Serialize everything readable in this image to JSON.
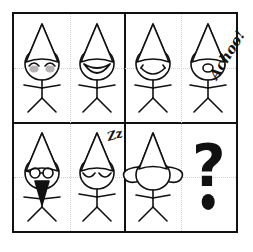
{
  "puzzle": {
    "title": "Non-verbal reasoning stick-figure matrix",
    "grid": {
      "rows": 2,
      "columns": 4,
      "quadrants": 2
    },
    "colors": {
      "ink": "#111111",
      "paper": "#ffffff",
      "blush": "#b9b2b4",
      "minor_divider": "#cfcfcf"
    },
    "cells": [
      {
        "index": 1,
        "position": "row1-col1",
        "figure_name": "happy-blushing-gnome",
        "expression": "closed smiling eyes with blushing cheeks",
        "hat": "tall cone hat",
        "features": [
          "curved-closed-eyes",
          "blush-cheeks"
        ],
        "annotation": ""
      },
      {
        "index": 2,
        "position": "row1-col2",
        "figure_name": "big-smile-gnome",
        "expression": "wide open smiling mouth",
        "hat": "tall cone hat",
        "features": [
          "open-smile-mouth"
        ],
        "annotation": ""
      },
      {
        "index": 3,
        "position": "row1-col3",
        "figure_name": "sad-frowning-gnome",
        "expression": "downturned frowning mouth",
        "hat": "tall cone hat",
        "features": [
          "frown-mouth"
        ],
        "annotation": ""
      },
      {
        "index": 4,
        "position": "row1-col4",
        "figure_name": "sneezing-gnome",
        "expression": "small round open mouth, sneezing",
        "hat": "tall cone hat",
        "features": [
          "small-oval-mouth"
        ],
        "annotation": "Achoo!"
      },
      {
        "index": 5,
        "position": "row2-col1",
        "figure_name": "bearded-glasses-gnome",
        "expression": "round glasses and black beard",
        "hat": "tall cone hat",
        "features": [
          "round-glasses",
          "black-triangular-beard"
        ],
        "annotation": ""
      },
      {
        "index": 6,
        "position": "row2-col2",
        "figure_name": "sleeping-gnome",
        "expression": "closed sleeping eyes",
        "hat": "tall cone hat",
        "features": [
          "closed-sleeping-eyes"
        ],
        "annotation": "Zz"
      },
      {
        "index": 7,
        "position": "row2-col3",
        "figure_name": "big-eared-gnome",
        "expression": "blank face with large ears",
        "hat": "tall cone hat",
        "features": [
          "large-left-ear",
          "large-right-ear"
        ],
        "annotation": ""
      },
      {
        "index": 8,
        "position": "row2-col4",
        "figure_name": "missing-answer",
        "expression": "unknown",
        "hat": "",
        "features": [
          "question-mark"
        ],
        "annotation": "?"
      }
    ],
    "answer_placeholder": {
      "glyph": "?",
      "has_separate_dot": true
    }
  }
}
